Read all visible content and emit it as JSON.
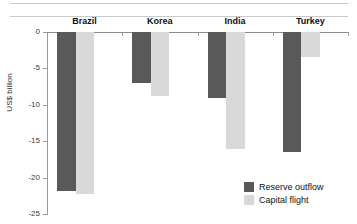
{
  "chart_data": {
    "type": "bar",
    "title": "",
    "xlabel": "",
    "ylabel": "US$ billion",
    "ylim": [
      -25,
      0
    ],
    "yticks": [
      0,
      -5,
      -10,
      -15,
      -20,
      -25
    ],
    "ytick_labels": [
      "0",
      "-5",
      "-10",
      "-15",
      "-20",
      "-25"
    ],
    "grid": false,
    "legend_position": "bottom-right",
    "categories": [
      "Brazil",
      "Korea",
      "India",
      "Turkey"
    ],
    "series": [
      {
        "name": "Reserve outflow",
        "color": "#595959",
        "values": [
          -21.9,
          -7.0,
          -9.0,
          -16.5
        ]
      },
      {
        "name": "Capital flight",
        "color": "#d9d9d9",
        "values": [
          -22.3,
          -8.8,
          -16.1,
          -3.4
        ]
      }
    ]
  },
  "legend": {
    "items": [
      {
        "label": "Reserve outflow",
        "swatch": "dark"
      },
      {
        "label": "Capital flight",
        "swatch": "light"
      }
    ]
  }
}
